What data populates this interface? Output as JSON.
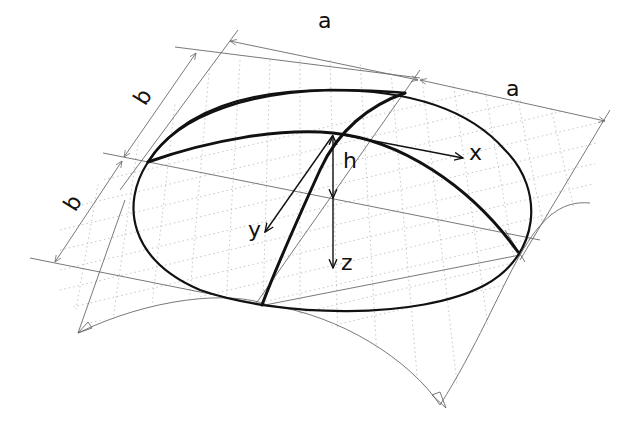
{
  "figure": {
    "dimensions": {
      "a_top_left": "a",
      "a_top_right": "a",
      "b_upper": "b",
      "b_lower": "b",
      "rise": "h"
    },
    "axes": {
      "x": "x",
      "y": "y",
      "z": "z"
    },
    "colors": {
      "outline": "#111111",
      "dimension_lines": "#6a6a6a",
      "surface_hatching": "#b8b8b8",
      "background": "#ffffff"
    }
  }
}
